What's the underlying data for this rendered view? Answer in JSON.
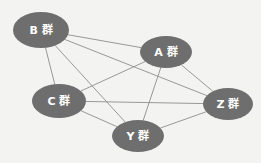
{
  "diagram": {
    "type": "undirected-graph",
    "title": "",
    "background_color": "#f3f3f1",
    "node_color": "#6e6e6e",
    "node_label_color": "#ffffff",
    "edge_color": "#8d8d8d",
    "node_count": 5,
    "edge_count": 10,
    "is_complete_graph": true,
    "nodes": [
      {
        "id": "B",
        "label": "B 群",
        "cx": 41,
        "cy": 30,
        "rx": 28,
        "ry": 18
      },
      {
        "id": "A",
        "label": "A 群",
        "cx": 166,
        "cy": 52,
        "rx": 26,
        "ry": 16
      },
      {
        "id": "C",
        "label": "C 群",
        "cx": 59,
        "cy": 101,
        "rx": 27,
        "ry": 17
      },
      {
        "id": "Z",
        "label": "Z 群",
        "cx": 228,
        "cy": 104,
        "rx": 25,
        "ry": 16
      },
      {
        "id": "Y",
        "label": "Y 群",
        "cx": 138,
        "cy": 136,
        "rx": 26,
        "ry": 16
      }
    ],
    "edges": [
      {
        "from": "B",
        "to": "A"
      },
      {
        "from": "B",
        "to": "C"
      },
      {
        "from": "B",
        "to": "Z"
      },
      {
        "from": "B",
        "to": "Y"
      },
      {
        "from": "A",
        "to": "C"
      },
      {
        "from": "A",
        "to": "Z"
      },
      {
        "from": "A",
        "to": "Y"
      },
      {
        "from": "C",
        "to": "Z"
      },
      {
        "from": "C",
        "to": "Y"
      },
      {
        "from": "Z",
        "to": "Y"
      }
    ]
  }
}
